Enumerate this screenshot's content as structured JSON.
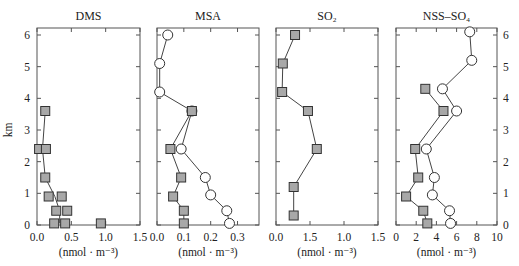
{
  "chart_data": [
    {
      "type": "scatter",
      "title": "DMS",
      "xlabel": "(nmol · m⁻³)",
      "ylabel": "km",
      "xlim": [
        0,
        1.5
      ],
      "ylim": [
        0,
        6.25
      ],
      "xticks": [
        0.0,
        0.5,
        1.0,
        1.5
      ],
      "xtick_labels": [
        "0.0",
        "0.5",
        "1.0",
        "1.5"
      ],
      "yticks": [
        0,
        1,
        2,
        3,
        4,
        5,
        6
      ],
      "series": [
        {
          "name": "squares",
          "marker": "square",
          "points": [
            [
              0.12,
              3.6
            ],
            [
              0.03,
              2.4
            ],
            [
              0.13,
              2.4
            ],
            [
              0.12,
              1.5
            ],
            [
              0.17,
              0.9
            ],
            [
              0.36,
              0.9
            ],
            [
              0.28,
              0.45
            ],
            [
              0.44,
              0.45
            ],
            [
              0.25,
              0.05
            ],
            [
              0.41,
              0.05
            ],
            [
              0.93,
              0.05
            ]
          ],
          "line": [
            [
              0.12,
              3.6
            ],
            [
              0.08,
              2.4
            ],
            [
              0.12,
              1.5
            ],
            [
              0.26,
              0.9
            ],
            [
              0.33,
              0.45
            ],
            [
              0.33,
              0.05
            ]
          ]
        }
      ]
    },
    {
      "type": "line",
      "title": "MSA",
      "xlabel": "(nmol · m⁻³)",
      "xlim": [
        0,
        0.38
      ],
      "ylim": [
        0,
        6.25
      ],
      "xticks": [
        0.0,
        0.1,
        0.2,
        0.3
      ],
      "xtick_labels": [
        "0.0",
        "0.1",
        "0.2",
        "0.3"
      ],
      "series": [
        {
          "name": "circles",
          "marker": "circle",
          "points": [
            [
              0.04,
              6.0
            ],
            [
              0.01,
              5.1
            ],
            [
              0.01,
              4.2
            ],
            [
              0.13,
              3.6
            ],
            [
              0.09,
              2.4
            ],
            [
              0.18,
              1.5
            ],
            [
              0.2,
              0.95
            ],
            [
              0.26,
              0.45
            ],
            [
              0.27,
              0.05
            ]
          ]
        },
        {
          "name": "squares",
          "marker": "square",
          "points": [
            [
              0.13,
              3.6
            ],
            [
              0.05,
              2.4
            ],
            [
              0.09,
              1.5
            ],
            [
              0.06,
              0.9
            ],
            [
              0.1,
              0.45
            ],
            [
              0.1,
              0.05
            ]
          ]
        }
      ]
    },
    {
      "type": "line",
      "title": "SO₂",
      "xlabel": "(nmol · m⁻³)",
      "xlim": [
        0,
        1.5
      ],
      "ylim": [
        0,
        6.25
      ],
      "xticks": [
        0.0,
        0.5,
        1.0,
        1.5
      ],
      "xtick_labels": [
        "0.0",
        "1.5",
        "1.0",
        "1.5"
      ],
      "series": [
        {
          "name": "squares",
          "marker": "square",
          "points": [
            [
              0.28,
              6.0
            ],
            [
              0.1,
              5.1
            ],
            [
              0.09,
              4.2
            ],
            [
              0.47,
              3.6
            ],
            [
              0.6,
              2.4
            ],
            [
              0.26,
              1.2
            ],
            [
              0.26,
              0.3
            ]
          ]
        }
      ]
    },
    {
      "type": "line",
      "title": "NSS–SO₄",
      "xlabel": "(nmol · m⁻³)",
      "xlim": [
        0,
        10
      ],
      "ylim": [
        0,
        6.25
      ],
      "xticks": [
        0,
        2,
        4,
        6,
        8,
        10
      ],
      "xtick_labels": [
        "0",
        "2",
        "4",
        "6",
        "8",
        "10"
      ],
      "yticks_right": [
        0,
        1,
        2,
        3,
        4,
        5,
        6
      ],
      "series": [
        {
          "name": "circles",
          "marker": "circle",
          "points": [
            [
              7.3,
              6.1
            ],
            [
              7.5,
              5.2
            ],
            [
              4.6,
              4.3
            ],
            [
              6.0,
              3.6
            ],
            [
              3.0,
              2.4
            ],
            [
              3.8,
              1.5
            ],
            [
              3.6,
              0.95
            ],
            [
              5.3,
              0.45
            ],
            [
              5.4,
              0.05
            ]
          ]
        },
        {
          "name": "squares",
          "marker": "square",
          "points": [
            [
              2.9,
              4.3
            ],
            [
              4.7,
              3.6
            ],
            [
              1.9,
              2.4
            ],
            [
              2.2,
              1.5
            ],
            [
              1.0,
              0.9
            ],
            [
              2.7,
              0.45
            ],
            [
              3.1,
              0.05
            ]
          ]
        }
      ]
    }
  ],
  "axis": {
    "y_label": "km",
    "y_ticks": [
      "0",
      "1",
      "2",
      "3",
      "4",
      "5",
      "6"
    ]
  },
  "colors": {
    "square_fill": "#a8a8a8",
    "marker_stroke": "#333333",
    "line": "#444444",
    "axis": "#555555"
  }
}
